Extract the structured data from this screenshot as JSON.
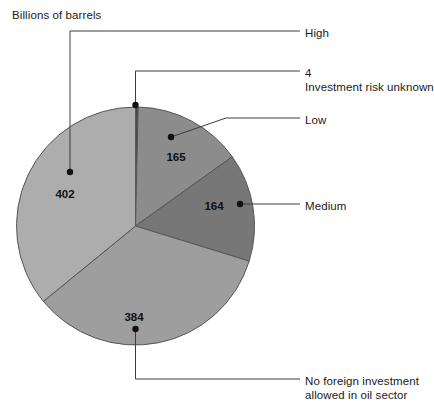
{
  "chart_data": {
    "type": "pie",
    "title": "",
    "axis_title": "Billions of barrels",
    "unit": "Billions of barrels",
    "categories": [
      "Investment risk unknown",
      "Low",
      "Medium",
      "No foreign investment allowed in oil sector",
      "High"
    ],
    "values": [
      4,
      165,
      164,
      384,
      402
    ],
    "total": 1119,
    "legend_position": "callouts",
    "grid": false,
    "slices": [
      {
        "id": "unknown",
        "label": "Investment risk unknown",
        "callout_number": "4",
        "value": 4,
        "value_text": "4",
        "color": "#4a4a4a",
        "start_angle": 0.0,
        "end_angle": 1.29,
        "show_value_on_slice": false
      },
      {
        "id": "low",
        "label": "Low",
        "value": 165,
        "value_text": "165",
        "color": "#8c8c8c",
        "start_angle": 1.29,
        "end_angle": 54.39,
        "show_value_on_slice": true,
        "value_x": 176,
        "value_y": 157
      },
      {
        "id": "medium",
        "label": "Medium",
        "value": 164,
        "value_text": "164",
        "color": "#777777",
        "start_angle": 54.39,
        "end_angle": 107.16,
        "show_value_on_slice": true,
        "value_x": 214,
        "value_y": 206
      },
      {
        "id": "no-foreign-investment",
        "label": "No foreign investment allowed in oil sector",
        "value": 384,
        "value_text": "384",
        "color": "#9e9e9e",
        "start_angle": 107.16,
        "end_angle": 230.7,
        "show_value_on_slice": true,
        "value_x": 134,
        "value_y": 317
      },
      {
        "id": "high",
        "label": "High",
        "value": 402,
        "value_text": "402",
        "color": "#adadad",
        "start_angle": 230.7,
        "end_angle": 360.0,
        "show_value_on_slice": true,
        "value_x": 65,
        "value_y": 194
      }
    ],
    "callouts": [
      {
        "id": "high",
        "text": "High",
        "x": 305,
        "y": 26
      },
      {
        "id": "unknown",
        "text": "4",
        "x": 305,
        "y": 66
      },
      {
        "id": "unknown_sub",
        "text": "Investment risk unknown",
        "x": 305,
        "y": 80
      },
      {
        "id": "low",
        "text": "Low",
        "x": 305,
        "y": 113
      },
      {
        "id": "medium",
        "text": "Medium",
        "x": 305,
        "y": 199
      },
      {
        "id": "nofi_1",
        "text": "No foreign investment",
        "x": 305,
        "y": 374
      },
      {
        "id": "nofi_2",
        "text": "allowed in oil sector",
        "x": 305,
        "y": 388
      }
    ],
    "colors": {
      "background": "#ffffff",
      "text": "#1a1a1a",
      "leader_line": "#3c3c3c",
      "slice_border": "#555555"
    }
  }
}
